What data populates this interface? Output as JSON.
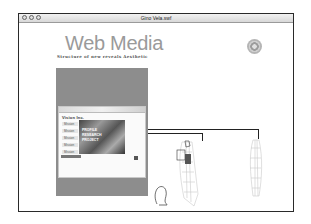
{
  "window": {
    "title": "Gino Vela.swf",
    "buttons": [
      "close",
      "minimize",
      "zoom"
    ]
  },
  "header": {
    "brand": "Web Media",
    "tagline": "Structure of new reveals Aesthetic",
    "logo_icon": "circle-target-logo"
  },
  "preview": {
    "heading": "Vision Inc.",
    "nav_items": [
      "Mission",
      "Mission",
      "Mission",
      "Mission",
      "Mission"
    ],
    "hero_text": [
      "PROFILE",
      "RESEARCH",
      "PROJECT"
    ]
  },
  "figures": {
    "items": [
      "head-outline",
      "arm-model-selected",
      "arm-model-wireframe"
    ]
  }
}
